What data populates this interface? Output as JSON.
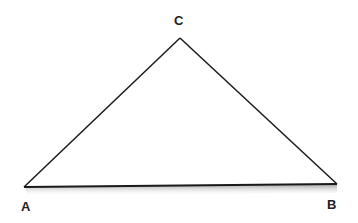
{
  "diagram": {
    "type": "triangle",
    "vertices": [
      {
        "label": "A",
        "x": 24,
        "y": 187
      },
      {
        "label": "B",
        "x": 337,
        "y": 184
      },
      {
        "label": "C",
        "x": 180,
        "y": 38
      }
    ],
    "labels": {
      "A": "A",
      "B": "B",
      "C": "C"
    },
    "stroke_color": "#1a1a1a"
  }
}
